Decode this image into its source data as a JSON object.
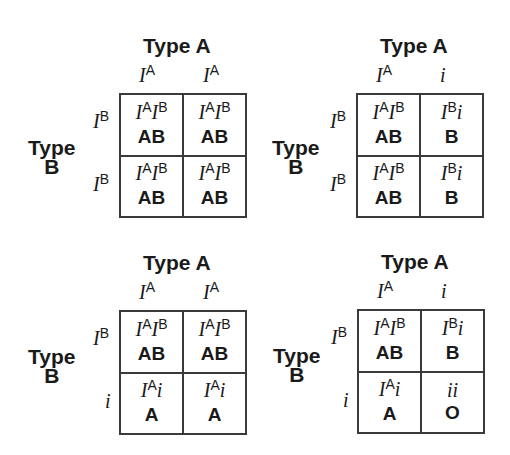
{
  "squares": [
    {
      "id": "top-left",
      "top_parent": "Type A",
      "side_parent": [
        "Type",
        "B"
      ],
      "col_alleles": [
        {
          "base": "I",
          "sup": "A"
        },
        {
          "base": "I",
          "sup": "A"
        }
      ],
      "row_alleles": [
        {
          "base": "I",
          "sup": "B"
        },
        {
          "base": "I",
          "sup": "B"
        }
      ],
      "cells": [
        [
          {
            "g1": "I",
            "s1": "A",
            "g2": "I",
            "s2": "B",
            "g3": "",
            "phenotype": "AB"
          },
          {
            "g1": "I",
            "s1": "A",
            "g2": "I",
            "s2": "B",
            "g3": "",
            "phenotype": "AB"
          }
        ],
        [
          {
            "g1": "I",
            "s1": "A",
            "g2": "I",
            "s2": "B",
            "g3": "",
            "phenotype": "AB"
          },
          {
            "g1": "I",
            "s1": "A",
            "g2": "I",
            "s2": "B",
            "g3": "",
            "phenotype": "AB"
          }
        ]
      ]
    },
    {
      "id": "top-right",
      "top_parent": "Type A",
      "side_parent": [
        "Type",
        "B"
      ],
      "col_alleles": [
        {
          "base": "I",
          "sup": "A"
        },
        {
          "base": "i",
          "sup": ""
        }
      ],
      "row_alleles": [
        {
          "base": "I",
          "sup": "B"
        },
        {
          "base": "I",
          "sup": "B"
        }
      ],
      "cells": [
        [
          {
            "g1": "I",
            "s1": "A",
            "g2": "I",
            "s2": "B",
            "g3": "",
            "phenotype": "AB"
          },
          {
            "g1": "I",
            "s1": "B",
            "g2": "",
            "s2": "",
            "g3": "i",
            "phenotype": "B"
          }
        ],
        [
          {
            "g1": "I",
            "s1": "A",
            "g2": "I",
            "s2": "B",
            "g3": "",
            "phenotype": "AB"
          },
          {
            "g1": "I",
            "s1": "B",
            "g2": "",
            "s2": "",
            "g3": "i",
            "phenotype": "B"
          }
        ]
      ]
    },
    {
      "id": "bottom-left",
      "top_parent": "Type A",
      "side_parent": [
        "Type",
        "B"
      ],
      "col_alleles": [
        {
          "base": "I",
          "sup": "A"
        },
        {
          "base": "I",
          "sup": "A"
        }
      ],
      "row_alleles": [
        {
          "base": "I",
          "sup": "B"
        },
        {
          "base": "i",
          "sup": ""
        }
      ],
      "cells": [
        [
          {
            "g1": "I",
            "s1": "A",
            "g2": "I",
            "s2": "B",
            "g3": "",
            "phenotype": "AB"
          },
          {
            "g1": "I",
            "s1": "A",
            "g2": "I",
            "s2": "B",
            "g3": "",
            "phenotype": "AB"
          }
        ],
        [
          {
            "g1": "I",
            "s1": "A",
            "g2": "",
            "s2": "",
            "g3": "i",
            "phenotype": "A"
          },
          {
            "g1": "I",
            "s1": "A",
            "g2": "",
            "s2": "",
            "g3": "i",
            "phenotype": "A"
          }
        ]
      ]
    },
    {
      "id": "bottom-right",
      "top_parent": "Type A",
      "side_parent": [
        "Type",
        "B"
      ],
      "col_alleles": [
        {
          "base": "I",
          "sup": "A"
        },
        {
          "base": "i",
          "sup": ""
        }
      ],
      "row_alleles": [
        {
          "base": "I",
          "sup": "B"
        },
        {
          "base": "i",
          "sup": ""
        }
      ],
      "cells": [
        [
          {
            "g1": "I",
            "s1": "A",
            "g2": "I",
            "s2": "B",
            "g3": "",
            "phenotype": "AB"
          },
          {
            "g1": "I",
            "s1": "B",
            "g2": "",
            "s2": "",
            "g3": "i",
            "phenotype": "B"
          }
        ],
        [
          {
            "g1": "I",
            "s1": "A",
            "g2": "",
            "s2": "",
            "g3": "i",
            "phenotype": "A"
          },
          {
            "g1": "",
            "s1": "",
            "g2": "",
            "s2": "",
            "g3": "ii",
            "phenotype": "O"
          }
        ]
      ]
    }
  ]
}
